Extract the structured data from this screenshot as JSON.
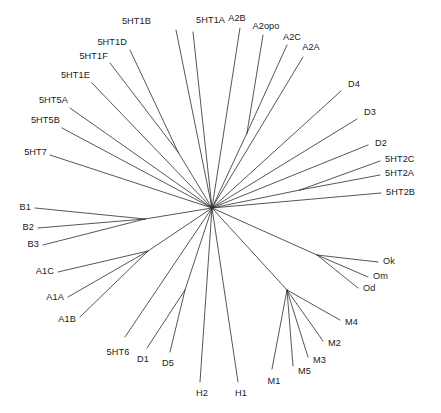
{
  "figure": {
    "name": "phylogenetic-tree",
    "type": "unrooted-radial-tree",
    "width": 441,
    "height": 413,
    "background_color": "#ffffff",
    "line_color": "#2b2b2b",
    "text_color": "#1a1a1a"
  },
  "chart_data": {
    "type": "tree",
    "layout": "unrooted radial (star) phylogram",
    "title": "",
    "xlabel": "",
    "ylabel": "",
    "grid": false,
    "legend": "none",
    "root": {
      "id": "center",
      "x": 212,
      "y": 208
    },
    "internal_nodes": [
      {
        "id": "n-5ht1df",
        "x": 178,
        "y": 152,
        "parent": "center"
      },
      {
        "id": "n-a2",
        "x": 247,
        "y": 133,
        "parent": "center"
      },
      {
        "id": "n-b",
        "x": 145,
        "y": 219,
        "parent": "center"
      },
      {
        "id": "n-a1",
        "x": 148,
        "y": 251,
        "parent": "center"
      },
      {
        "id": "n-o",
        "x": 317,
        "y": 255,
        "parent": "center"
      },
      {
        "id": "n-m",
        "x": 287,
        "y": 290,
        "parent": "center"
      },
      {
        "id": "n-d15",
        "x": 185,
        "y": 290,
        "parent": "center"
      },
      {
        "id": "n-5ht2",
        "x": 300,
        "y": 190,
        "parent": "center"
      }
    ],
    "tips": [
      {
        "label": "5HT1B",
        "tip_x": 176,
        "tip_y": 30,
        "parent": "center",
        "label_x": 151,
        "label_y": 22,
        "anchor": "end"
      },
      {
        "label": "5HT1A",
        "tip_x": 193,
        "tip_y": 32,
        "parent": "center",
        "label_x": 196,
        "label_y": 21,
        "anchor": "start"
      },
      {
        "label": "5HT1D",
        "tip_x": 130,
        "tip_y": 50,
        "parent": "n-5ht1df",
        "label_x": 127,
        "label_y": 43,
        "anchor": "end"
      },
      {
        "label": "5HT1F",
        "tip_x": 110,
        "tip_y": 63,
        "parent": "n-5ht1df",
        "label_x": 108,
        "label_y": 57,
        "anchor": "end"
      },
      {
        "label": "5HT1E",
        "tip_x": 92,
        "tip_y": 83,
        "parent": "center",
        "label_x": 90,
        "label_y": 76,
        "anchor": "end"
      },
      {
        "label": "5HT5A",
        "tip_x": 70,
        "tip_y": 108,
        "parent": "center",
        "label_x": 68,
        "label_y": 101,
        "anchor": "end"
      },
      {
        "label": "5HT5B",
        "tip_x": 62,
        "tip_y": 128,
        "parent": "center",
        "label_x": 60,
        "label_y": 121,
        "anchor": "end"
      },
      {
        "label": "5HT7",
        "tip_x": 50,
        "tip_y": 155,
        "parent": "center",
        "label_x": 47,
        "label_y": 153,
        "anchor": "end"
      },
      {
        "label": "A2B",
        "tip_x": 240,
        "tip_y": 28,
        "parent": "center",
        "label_x": 237,
        "label_y": 19,
        "anchor": "mid"
      },
      {
        "label": "A2opo",
        "tip_x": 263,
        "tip_y": 35,
        "parent": "n-a2",
        "label_x": 266,
        "label_y": 27,
        "anchor": "mid"
      },
      {
        "label": "A2C",
        "tip_x": 287,
        "tip_y": 45,
        "parent": "n-a2",
        "label_x": 292,
        "label_y": 38,
        "anchor": "mid"
      },
      {
        "label": "A2A",
        "tip_x": 303,
        "tip_y": 57,
        "parent": "center",
        "label_x": 311,
        "label_y": 48,
        "anchor": "mid"
      },
      {
        "label": "D4",
        "tip_x": 341,
        "tip_y": 91,
        "parent": "center",
        "label_x": 348,
        "label_y": 85,
        "anchor": "start"
      },
      {
        "label": "D3",
        "tip_x": 357,
        "tip_y": 119,
        "parent": "center",
        "label_x": 364,
        "label_y": 113,
        "anchor": "start"
      },
      {
        "label": "D2",
        "tip_x": 368,
        "tip_y": 145,
        "parent": "center",
        "label_x": 375,
        "label_y": 144,
        "anchor": "start"
      },
      {
        "label": "5HT2C",
        "tip_x": 380,
        "tip_y": 161,
        "parent": "n-5ht2",
        "label_x": 385,
        "label_y": 160,
        "anchor": "start"
      },
      {
        "label": "5HT2A",
        "tip_x": 380,
        "tip_y": 175,
        "parent": "n-5ht2",
        "label_x": 385,
        "label_y": 174,
        "anchor": "start"
      },
      {
        "label": "5HT2B",
        "tip_x": 381,
        "tip_y": 193,
        "parent": "center",
        "label_x": 386,
        "label_y": 193,
        "anchor": "start"
      },
      {
        "label": "B1",
        "tip_x": 35,
        "tip_y": 208,
        "parent": "n-b",
        "label_x": 31,
        "label_y": 208,
        "anchor": "end"
      },
      {
        "label": "B2",
        "tip_x": 38,
        "tip_y": 228,
        "parent": "n-b",
        "label_x": 34,
        "label_y": 228,
        "anchor": "end"
      },
      {
        "label": "B3",
        "tip_x": 43,
        "tip_y": 245,
        "parent": "n-b",
        "label_x": 39,
        "label_y": 245,
        "anchor": "end"
      },
      {
        "label": "A1C",
        "tip_x": 58,
        "tip_y": 272,
        "parent": "n-a1",
        "label_x": 54,
        "label_y": 272,
        "anchor": "end"
      },
      {
        "label": "A1A",
        "tip_x": 68,
        "tip_y": 297,
        "parent": "n-a1",
        "label_x": 64,
        "label_y": 298,
        "anchor": "end"
      },
      {
        "label": "A1B",
        "tip_x": 80,
        "tip_y": 317,
        "parent": "n-a1",
        "label_x": 76,
        "label_y": 320,
        "anchor": "end"
      },
      {
        "label": "Ok",
        "tip_x": 378,
        "tip_y": 262,
        "parent": "n-o",
        "label_x": 383,
        "label_y": 262,
        "anchor": "start"
      },
      {
        "label": "Om",
        "tip_x": 368,
        "tip_y": 277,
        "parent": "n-o",
        "label_x": 373,
        "label_y": 277,
        "anchor": "start"
      },
      {
        "label": "Od",
        "tip_x": 358,
        "tip_y": 288,
        "parent": "n-o",
        "label_x": 363,
        "label_y": 289,
        "anchor": "start"
      },
      {
        "label": "M4",
        "tip_x": 340,
        "tip_y": 320,
        "parent": "n-m",
        "label_x": 345,
        "label_y": 323,
        "anchor": "start"
      },
      {
        "label": "M2",
        "tip_x": 323,
        "tip_y": 341,
        "parent": "n-m",
        "label_x": 328,
        "label_y": 344,
        "anchor": "start"
      },
      {
        "label": "M3",
        "tip_x": 308,
        "tip_y": 357,
        "parent": "n-m",
        "label_x": 313,
        "label_y": 361,
        "anchor": "start"
      },
      {
        "label": "M5",
        "tip_x": 293,
        "tip_y": 366,
        "parent": "n-m",
        "label_x": 298,
        "label_y": 372,
        "anchor": "start"
      },
      {
        "label": "M1",
        "tip_x": 272,
        "tip_y": 369,
        "parent": "n-m",
        "label_x": 274,
        "label_y": 382,
        "anchor": "mid"
      },
      {
        "label": "H1",
        "tip_x": 238,
        "tip_y": 382,
        "parent": "center",
        "label_x": 241,
        "label_y": 394,
        "anchor": "mid"
      },
      {
        "label": "H2",
        "tip_x": 200,
        "tip_y": 382,
        "parent": "center",
        "label_x": 202,
        "label_y": 394,
        "anchor": "mid"
      },
      {
        "label": "D5",
        "tip_x": 170,
        "tip_y": 352,
        "parent": "n-d15",
        "label_x": 168,
        "label_y": 364,
        "anchor": "mid"
      },
      {
        "label": "D1",
        "tip_x": 147,
        "tip_y": 348,
        "parent": "n-d15",
        "label_x": 143,
        "label_y": 360,
        "anchor": "mid"
      },
      {
        "label": "5HT6",
        "tip_x": 125,
        "tip_y": 337,
        "parent": "center",
        "label_x": 118,
        "label_y": 353,
        "anchor": "mid"
      }
    ]
  }
}
